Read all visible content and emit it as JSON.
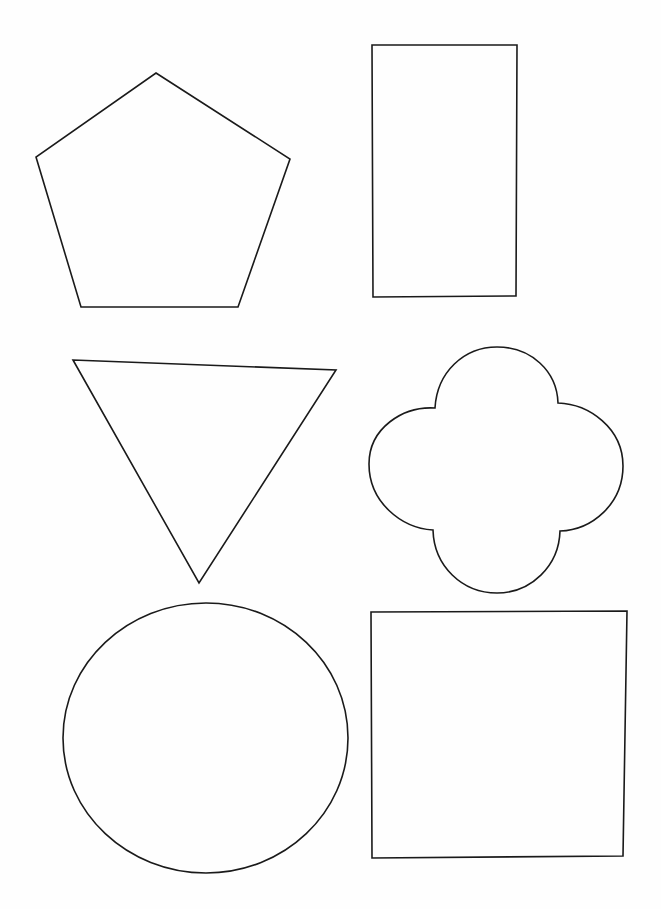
{
  "page": {
    "background_color": "#fefefe",
    "ink_color": "#1a1a1a",
    "width": 661,
    "height": 909
  },
  "shapes": [
    {
      "id": "pentagon",
      "name": "pentagon",
      "row": 1,
      "column": 1,
      "sides": 5,
      "fill": "none",
      "stroke": "#1a1a1a",
      "stroke_width": 1.6,
      "bounds": {
        "x": 36,
        "y": 72,
        "width": 255,
        "height": 236
      },
      "vertices": [
        [
          156,
          73
        ],
        [
          290,
          159
        ],
        [
          238,
          307
        ],
        [
          81,
          307
        ],
        [
          36,
          157
        ]
      ],
      "path": "M 156 73 L 290 159 L 238 307 L 81 307 L 36 157 Z"
    },
    {
      "id": "rectangle",
      "name": "rectangle",
      "row": 1,
      "column": 2,
      "sides": 4,
      "fill": "none",
      "stroke": "#1a1a1a",
      "stroke_width": 1.6,
      "bounds": {
        "x": 372,
        "y": 45,
        "width": 145,
        "height": 252
      },
      "vertices": [
        [
          372,
          45
        ],
        [
          517,
          45
        ],
        [
          516,
          296
        ],
        [
          373,
          297
        ]
      ],
      "path": "M 372 45 L 517 45 L 516 296 L 373 297 Z"
    },
    {
      "id": "triangle",
      "name": "inverted-triangle",
      "row": 2,
      "column": 1,
      "sides": 3,
      "fill": "none",
      "stroke": "#1a1a1a",
      "stroke_width": 1.6,
      "bounds": {
        "x": 73,
        "y": 360,
        "width": 263,
        "height": 223
      },
      "vertices": [
        [
          73,
          360
        ],
        [
          336,
          370
        ],
        [
          199,
          583
        ]
      ],
      "path": "M 73 360 L 336 370 L 199 583 Z"
    },
    {
      "id": "quatrefoil",
      "name": "quatrefoil",
      "row": 2,
      "column": 2,
      "lobes": 4,
      "fill": "none",
      "stroke": "#1a1a1a",
      "stroke_width": 1.6,
      "bounds": {
        "x": 369,
        "y": 347,
        "width": 254,
        "height": 246
      },
      "center": [
        497,
        470
      ],
      "cusps": [
        [
          435,
          408
        ],
        [
          558,
          403
        ],
        [
          560,
          531
        ],
        [
          433,
          530
        ]
      ],
      "path": "M 435 408 C 437 372 464 347 497 347 C 531 347 557 371 558 403 C 589 404 623 428 623 466 C 623 504 592 530 560 531 C 559 566 531 593 497 593 C 462 593 434 566 433 530 C 401 528 369 502 369 464 C 369 428 403 406 435 408 Z"
    },
    {
      "id": "circle",
      "name": "circle",
      "row": 3,
      "column": 1,
      "fill": "none",
      "stroke": "#1a1a1a",
      "stroke_width": 1.6,
      "bounds": {
        "x": 63,
        "y": 603,
        "width": 285,
        "height": 270
      },
      "center": [
        206,
        738
      ],
      "radius_x": 142,
      "radius_y": 135,
      "path": "M 206 603 C 284 603 348 663 348 738 C 348 813 284 873 206 873 C 128 873 63 813 63 738 C 63 663 128 603 206 603 Z"
    },
    {
      "id": "square",
      "name": "square",
      "row": 3,
      "column": 2,
      "sides": 4,
      "fill": "none",
      "stroke": "#1a1a1a",
      "stroke_width": 1.6,
      "bounds": {
        "x": 371,
        "y": 611,
        "width": 256,
        "height": 247
      },
      "vertices": [
        [
          371,
          612
        ],
        [
          627,
          611
        ],
        [
          623,
          856
        ],
        [
          372,
          858
        ]
      ],
      "path": "M 371 612 L 627 611 L 623 856 L 372 858 Z"
    }
  ]
}
